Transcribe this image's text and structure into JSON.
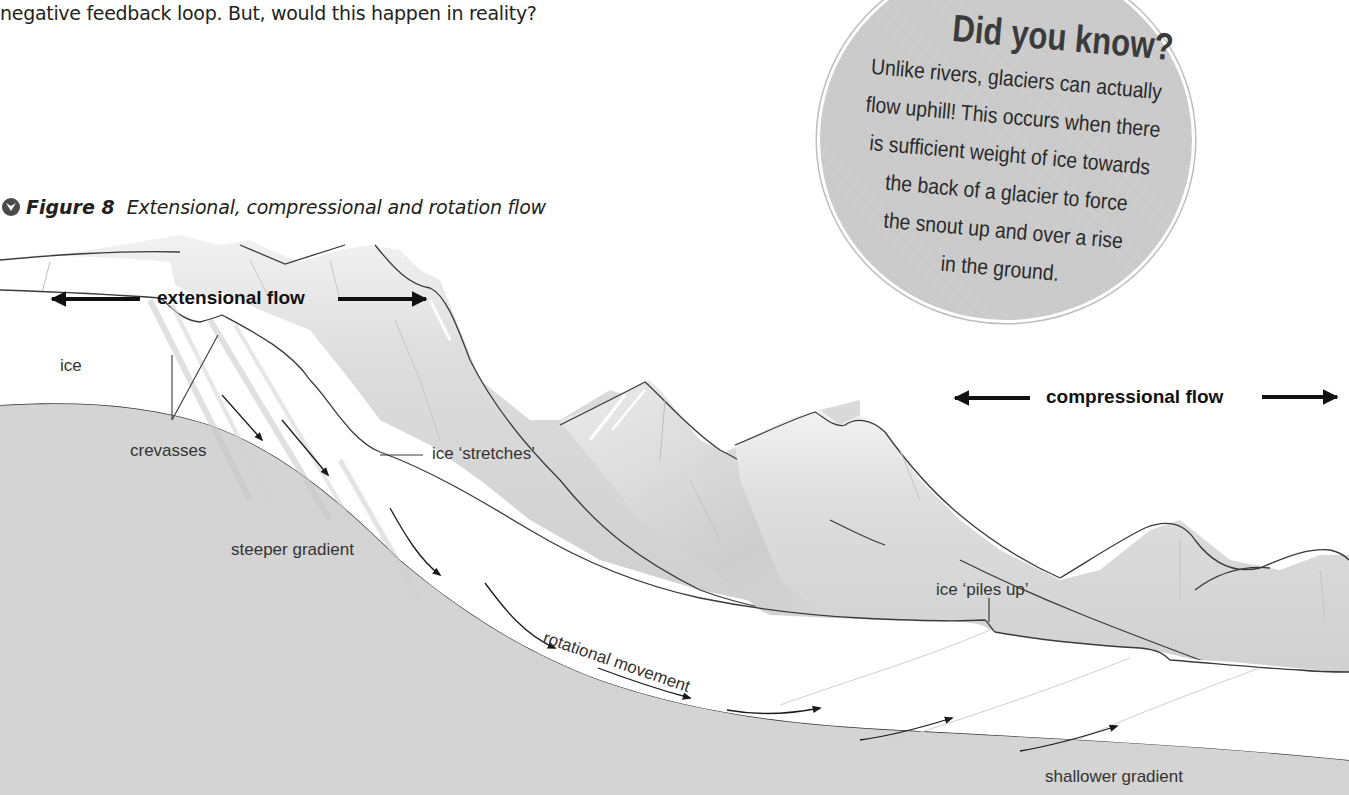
{
  "page": {
    "intro_text": "negative feedback loop. But, would this happen in reality?"
  },
  "figure": {
    "icon": "chevron-down-circle-icon",
    "label": "Figure 8",
    "caption": "Extensional, compressional and rotation flow"
  },
  "callout": {
    "title": "Did you know?",
    "body_lines": [
      "Unlike rivers, glaciers can actually",
      "flow uphill! This occurs when there",
      "is sufficient weight of ice towards",
      "the back of a glacier to force",
      "the snout up and over a rise",
      "in the ground."
    ]
  },
  "diagram": {
    "flow_labels": {
      "extensional": "extensional flow",
      "compressional": "compressional flow"
    },
    "labels": {
      "ice": "ice",
      "crevasses": "crevasses",
      "ice_stretches": "ice ‘stretches’",
      "steeper_gradient": "steeper gradient",
      "ice_piles_up": "ice ‘piles up’",
      "rotational_movement": "rotational movement",
      "shallower_gradient": "shallower gradient"
    },
    "colors": {
      "bedrock": "#d4d4d4",
      "mountain": "#d9d9d9",
      "mountain_shade": "#c4c4c4",
      "ice": "#ffffff",
      "outline": "#3a3a3a",
      "arrow": "#111111",
      "callout_fill": "#c8c8c8"
    }
  }
}
